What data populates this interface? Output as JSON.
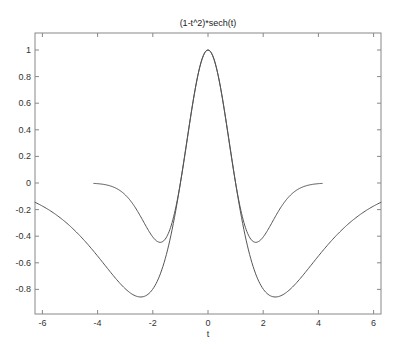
{
  "chart_data": {
    "type": "line",
    "title": "(1-t^2)*sech(t)",
    "xlabel": "t",
    "ylabel": "",
    "xlim": [
      -6.2832,
      6.2832
    ],
    "ylim": [
      -1.0,
      1.13
    ],
    "xticks": [
      -6,
      -4,
      -2,
      0,
      2,
      4,
      6
    ],
    "yticks": [
      1,
      0.8,
      0.6,
      0.4,
      0.2,
      0,
      -0.2,
      -0.4,
      -0.6,
      -0.8
    ],
    "grid": false,
    "legend": null,
    "series": [
      {
        "name": "(1-t^2)*sech(t)",
        "color": "#555555",
        "x": [
          -6.28,
          -5.5,
          -5.0,
          -4.5,
          -4.0,
          -3.5,
          -3.0,
          -2.5,
          -2.47,
          -2.0,
          -1.5,
          -1.0,
          -0.5,
          0,
          0.5,
          1.0,
          1.5,
          2.0,
          2.47,
          2.5,
          3.0,
          3.5,
          4.0,
          4.5,
          5.0,
          5.5,
          6.28
        ],
        "y": [
          -0.148,
          -0.238,
          -0.322,
          -0.422,
          -0.549,
          -0.68,
          -0.79,
          -0.861,
          -0.862,
          -0.709,
          -0.531,
          0.0,
          0.665,
          1.0,
          0.665,
          0.0,
          -0.531,
          -0.709,
          -0.862,
          -0.861,
          -0.79,
          -0.68,
          -0.549,
          -0.422,
          -0.322,
          -0.238,
          -0.148
        ]
      },
      {
        "name": "(1-t^2)*exp(-t^2/2)",
        "color": "#555555",
        "x": [
          -4.15,
          -3.5,
          -3.0,
          -2.5,
          -2.0,
          -1.73,
          -1.5,
          -1.0,
          -0.5,
          0,
          0.5,
          1.0,
          1.5,
          1.73,
          2.0,
          2.5,
          3.0,
          3.5,
          4.15
        ],
        "y": [
          -0.003,
          -0.049,
          -0.089,
          -0.23,
          -0.406,
          -0.446,
          -0.406,
          0.0,
          0.662,
          1.0,
          0.662,
          0.0,
          -0.406,
          -0.446,
          -0.406,
          -0.23,
          -0.089,
          -0.049,
          -0.003
        ]
      }
    ]
  },
  "plot": {
    "title": "(1-t^2)*sech(t)",
    "xlabel": "t",
    "xtick_labels": [
      "-6",
      "-4",
      "-2",
      "0",
      "2",
      "4",
      "6"
    ],
    "ytick_labels": [
      "1",
      "0.8",
      "0.6",
      "0.4",
      "0.2",
      "0",
      "-0.2",
      "-0.4",
      "-0.6",
      "-0.8"
    ]
  }
}
